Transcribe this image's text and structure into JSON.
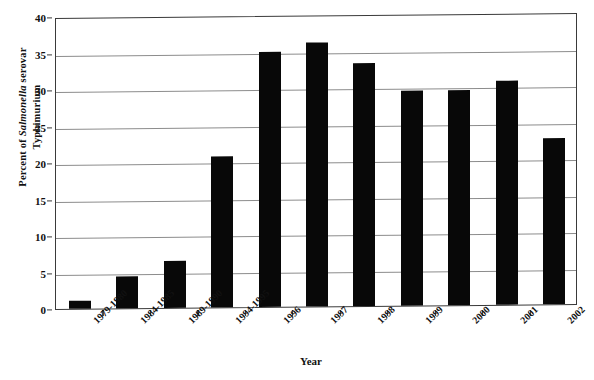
{
  "chart_data": {
    "type": "bar",
    "title": "",
    "xlabel": "Year",
    "ylabel": "Percent of Salmonella serovar Typhimurium",
    "ylabel_lines": [
      "Percent of Salmonella serovar",
      "Typhimurium"
    ],
    "ylabel_italic_word": "Salmonella",
    "categories": [
      "1979-1980",
      "1984-1985",
      "1989-1990",
      "1994-1995",
      "1996",
      "1997",
      "1998",
      "1999",
      "2000",
      "2001",
      "2002"
    ],
    "values": [
      1.1,
      4.4,
      6.5,
      20.7,
      34.9,
      36.1,
      33.3,
      29.4,
      29.5,
      30.7,
      22.8
    ],
    "ylim": [
      0,
      40
    ],
    "ytick_labels": [
      "0",
      "5",
      "10",
      "15",
      "20",
      "25",
      "30",
      "35",
      "40"
    ],
    "ytick_values": [
      0,
      5,
      10,
      15,
      20,
      25,
      30,
      35,
      40
    ],
    "grid": true,
    "legend": "none",
    "bar_color": "#080808",
    "grid_color": "#8c8c8c",
    "frame_color": "#3a3a3a",
    "background_color": "#ffffff"
  }
}
